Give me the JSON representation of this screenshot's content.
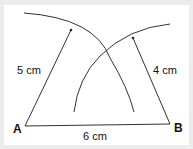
{
  "diagram": {
    "vertices": [
      {
        "id": "A",
        "label": "A"
      },
      {
        "id": "B",
        "label": "B"
      }
    ],
    "measurements": {
      "side_ab": "6 cm",
      "radius_a": "5 cm",
      "radius_b": "4 cm"
    },
    "colors": {
      "stroke": "#333333",
      "background": "#ffffff",
      "frame": "#ececec"
    }
  }
}
